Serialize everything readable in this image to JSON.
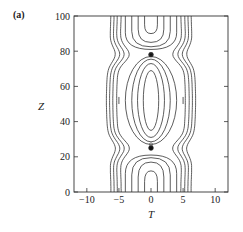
{
  "chart_data": {
    "type": "contour",
    "panel_label": "(a)",
    "title": "",
    "xlabel": "T",
    "ylabel": "Z",
    "xlim": [
      -12,
      12
    ],
    "ylim": [
      0,
      100
    ],
    "xticks": [
      -10,
      -5,
      0,
      5,
      10
    ],
    "yticks": [
      0,
      20,
      40,
      60,
      80,
      100
    ],
    "xtick_labels": [
      "−10",
      "−5",
      "0",
      "5",
      "10"
    ],
    "ytick_labels": [
      "0",
      "20",
      "40",
      "60",
      "80",
      "100"
    ],
    "grid": false,
    "legend": null,
    "features": [
      {
        "type": "singular_point",
        "T": 0,
        "Z": 78
      },
      {
        "type": "singular_point",
        "T": 0,
        "Z": 25
      },
      {
        "type": "closed_contour_center",
        "T": 0,
        "Z": 52
      },
      {
        "type": "open_contour_center",
        "T": 0,
        "Z": 100
      },
      {
        "type": "open_contour_center",
        "T": 0,
        "Z": 0
      }
    ],
    "contour_half_widths_at_center": [
      1.2,
      2.3,
      3.1,
      4.2,
      5.0,
      5.8,
      6.4
    ]
  }
}
